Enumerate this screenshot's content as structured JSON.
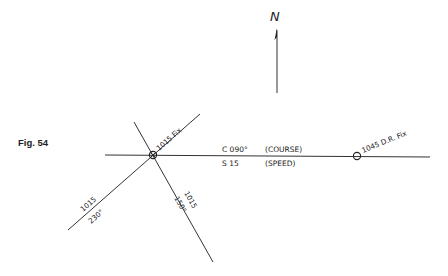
{
  "figure": {
    "label": "Fig. 54"
  },
  "north_arrow": {
    "symbol": "N"
  },
  "course_line": {
    "course_label": "C 090°",
    "course_note": "(COURSE)",
    "speed_label": "S 15",
    "speed_note": "(SPEED)"
  },
  "fix": {
    "label": "1015 Fix"
  },
  "dr_fix": {
    "label": "1045 D.R. Fix"
  },
  "lop_1": {
    "time": "1015",
    "bearing": "230°"
  },
  "lop_2": {
    "time": "1015",
    "bearing": "150°"
  },
  "colors": {
    "ink": "#222222",
    "background": "#ffffff"
  }
}
